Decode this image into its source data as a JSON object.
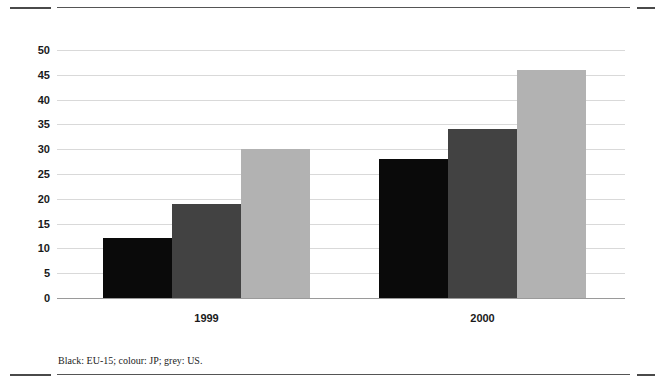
{
  "figure": {
    "caption": "Black: EU-15; colour: JP; grey: US.",
    "rules": {
      "top_left": "",
      "top_main": "",
      "top_right": "",
      "bottom_left": "",
      "bottom_main": "",
      "bottom_right": ""
    }
  },
  "chart_data": {
    "type": "bar",
    "title": "",
    "subtitle": "",
    "xlabel": "",
    "ylabel": "",
    "categories": [
      "1999",
      "2000"
    ],
    "series": [
      {
        "name": "EU-15",
        "color": "#0a0a0a",
        "legend_key": "Black",
        "values": [
          12,
          19
        ]
      },
      {
        "name": "JP",
        "color": "#424242",
        "legend_key": "colour",
        "values": [
          19,
          34
        ]
      },
      {
        "name": "US",
        "color": "#b2b2b2",
        "legend_key": "grey",
        "values": [
          30,
          46
        ]
      }
    ],
    "series_fixed": [
      {
        "name": "EU-15",
        "color": "#0a0a0a",
        "values": [
          12,
          28
        ]
      },
      {
        "name": "JP",
        "color": "#424242",
        "values": [
          19,
          34
        ]
      },
      {
        "name": "US",
        "color": "#b2b2b2",
        "values": [
          30,
          46
        ]
      }
    ],
    "ylim": [
      0,
      50
    ],
    "ytick_step": 5,
    "yticks": [
      "0",
      "5",
      "10",
      "15",
      "20",
      "25",
      "30",
      "35",
      "40",
      "45",
      "50"
    ],
    "ytick_values": [
      0,
      5,
      10,
      15,
      20,
      25,
      30,
      35,
      40,
      45,
      50
    ],
    "grid": true,
    "grid_color": "#d9d9d9",
    "legend": "none",
    "legend_position": "caption-below",
    "annotations": []
  }
}
